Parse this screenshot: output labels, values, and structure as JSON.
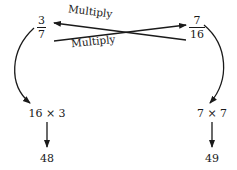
{
  "left_fraction": {
    "numerator": "3",
    "denominator": "7"
  },
  "right_fraction": {
    "numerator": "7",
    "denominator": "16"
  },
  "arrow_labels": {
    "top": "Multiply",
    "bottom": "Multiply"
  },
  "left_column": {
    "product_expression": "16 × 3",
    "result": "48"
  },
  "right_column": {
    "product_expression": "7 × 7",
    "result": "49"
  }
}
